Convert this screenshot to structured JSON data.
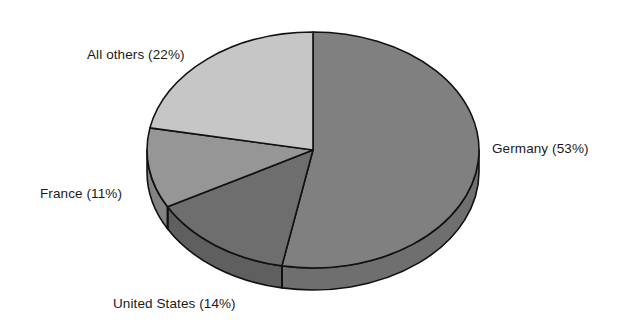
{
  "chart_data": {
    "type": "pie",
    "title": "",
    "subtitle": "",
    "xlabel": "",
    "ylabel": "",
    "legend_position": "none",
    "grid": false,
    "labels_inline": true,
    "start_angle_deg": 0,
    "direction": "clockwise",
    "three_d": true,
    "categories": [
      "Germany",
      "United States",
      "France",
      "All others"
    ],
    "values": [
      53,
      14,
      11,
      22
    ],
    "unit": "%",
    "slices": [
      {
        "name": "Germany",
        "value": 53,
        "label": "Germany (53%)",
        "color": "#808080",
        "side_color": "#6f6f6f",
        "start_deg": 0,
        "end_deg": 190.8
      },
      {
        "name": "United States",
        "value": 14,
        "label": "United States (14%)",
        "color": "#6e6e6e",
        "side_color": "#5f5f5f",
        "start_deg": 190.8,
        "end_deg": 241.2
      },
      {
        "name": "France",
        "value": 11,
        "label": "France (11%)",
        "color": "#969696",
        "side_color": "#838383",
        "start_deg": 241.2,
        "end_deg": 280.8
      },
      {
        "name": "All others",
        "value": 22,
        "label": "All others (22%)",
        "color": "#c6c6c6",
        "side_color": "#adadad",
        "start_deg": 280.8,
        "end_deg": 360
      }
    ],
    "outline_color": "#111111",
    "background_color": "#ffffff"
  },
  "labels": {
    "all_others": "All others (22%)",
    "germany": "Germany (53%)",
    "france": "France (11%)",
    "united_states": "United States (14%)"
  }
}
